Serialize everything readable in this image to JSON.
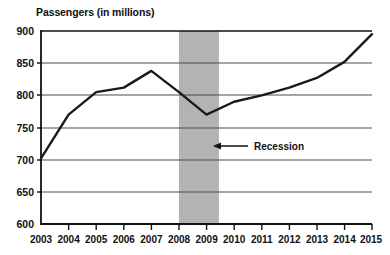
{
  "chart_data": {
    "type": "line",
    "title": "Passengers (in millions)",
    "xlabel": "",
    "ylabel": "Passengers (in millions)",
    "x": [
      2003,
      2004,
      2005,
      2006,
      2007,
      2008,
      2009,
      2010,
      2011,
      2012,
      2013,
      2014,
      2015
    ],
    "categories": [
      "2003",
      "2004",
      "2005",
      "2006",
      "2007",
      "2008",
      "2009",
      "2010",
      "2011",
      "2012",
      "2013",
      "2014",
      "2015"
    ],
    "values": [
      702,
      770,
      805,
      812,
      838,
      805,
      770,
      790,
      800,
      812,
      827,
      852,
      895
    ],
    "series": [
      {
        "name": "Passengers",
        "values": [
          702,
          770,
          805,
          812,
          838,
          805,
          770,
          790,
          800,
          812,
          827,
          852,
          895
        ]
      }
    ],
    "ylim": [
      600,
      900
    ],
    "yticks": [
      600,
      650,
      700,
      750,
      800,
      850,
      900
    ],
    "ytick_labels": [
      "600",
      "650",
      "700",
      "750",
      "800",
      "850",
      "900"
    ],
    "xlim": [
      2003,
      2015
    ],
    "grid": true,
    "legend": "none",
    "line_color": "#1a1a1a",
    "grid_color": "#4d4d4d",
    "axis_color": "#111111",
    "shaded_region": {
      "label": "Recession",
      "x_start": 2008.0,
      "x_end": 2009.45,
      "color": "#b3b3b3"
    },
    "annotations": [
      {
        "text": "Recession",
        "x": 2010.5,
        "y": 718,
        "arrow": "left-arrow-icon",
        "points_to": "recession-band"
      }
    ]
  }
}
